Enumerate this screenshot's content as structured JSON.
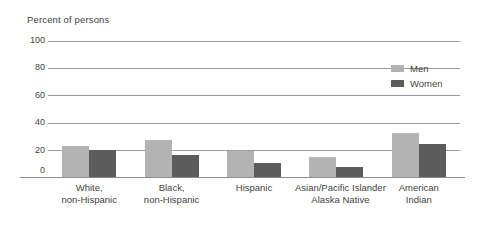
{
  "chart_data": {
    "type": "bar",
    "title": "Percent of persons",
    "xlabel": "",
    "ylabel": "Percent of persons",
    "ylim": [
      0,
      100
    ],
    "yticks": [
      0,
      20,
      40,
      60,
      80,
      100
    ],
    "grid": true,
    "legend_position": "top-right",
    "categories": [
      "White,\nnon-Hispanic",
      "Black,\nnon-Hispanic",
      "Hispanic",
      "Asian/Pacific Islander\nAlaska Native",
      "American\nIndian"
    ],
    "series": [
      {
        "name": "Men",
        "color": "#b3b3b3",
        "values": [
          23,
          27,
          19,
          15,
          32
        ]
      },
      {
        "name": "Women",
        "color": "#5c5c5c",
        "values": [
          20,
          16,
          10,
          7,
          24
        ]
      }
    ]
  },
  "axis": {
    "ytick_labels": [
      "100",
      "80",
      "60",
      "40",
      "20",
      "0"
    ]
  },
  "legend": {
    "items": [
      {
        "label": "Men"
      },
      {
        "label": "Women"
      }
    ]
  },
  "colors": {
    "men": "#b3b3b3",
    "women": "#5c5c5c",
    "gridline": "#9a9a9a",
    "text": "#3f3f3f",
    "background": "#ffffff"
  }
}
